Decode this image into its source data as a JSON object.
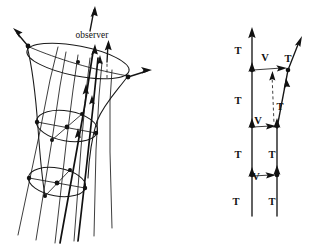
{
  "figure": {
    "title": "",
    "background_color": "#ffffff",
    "ink_color": "#111111",
    "width": 309,
    "height": 245,
    "panels": [
      {
        "id": "left-panel",
        "name": "congruence-of-worldlines-funnel",
        "description": "Hyperboloid funnel swept out by a congruence of timelike worldlines with three cross-sectional circles and an observer worldline",
        "labels": [
          {
            "id": "observer",
            "text": "observer",
            "x": 92,
            "y": 38
          }
        ]
      },
      {
        "id": "right-panel",
        "name": "lattice-of-T-and-V-vectors",
        "description": "Ladder diagram of two neighbouring worldlines connected by connecting vectors, tangent vectors T and separation vectors V",
        "labels": [
          {
            "id": "t1",
            "text": "T",
            "x": 238,
            "y": 54
          },
          {
            "id": "v1",
            "text": "V",
            "x": 265,
            "y": 61
          },
          {
            "id": "t2",
            "text": "T",
            "x": 288,
            "y": 62
          },
          {
            "id": "t3",
            "text": "T",
            "x": 238,
            "y": 104
          },
          {
            "id": "t4",
            "text": "T",
            "x": 280,
            "y": 110
          },
          {
            "id": "v2",
            "text": "V",
            "x": 258,
            "y": 124
          },
          {
            "id": "t5",
            "text": "T",
            "x": 238,
            "y": 158
          },
          {
            "id": "t6",
            "text": "T",
            "x": 272,
            "y": 158
          },
          {
            "id": "v3",
            "text": "V",
            "x": 256,
            "y": 180
          },
          {
            "id": "t7",
            "text": "T",
            "x": 236,
            "y": 205
          },
          {
            "id": "t8",
            "text": "T",
            "x": 272,
            "y": 205
          }
        ]
      }
    ],
    "glyph_legend": {
      "T": "tangent-vector-to-worldline",
      "V": "connecting-separation-vector",
      "observer": "observer-worldline-label"
    }
  }
}
